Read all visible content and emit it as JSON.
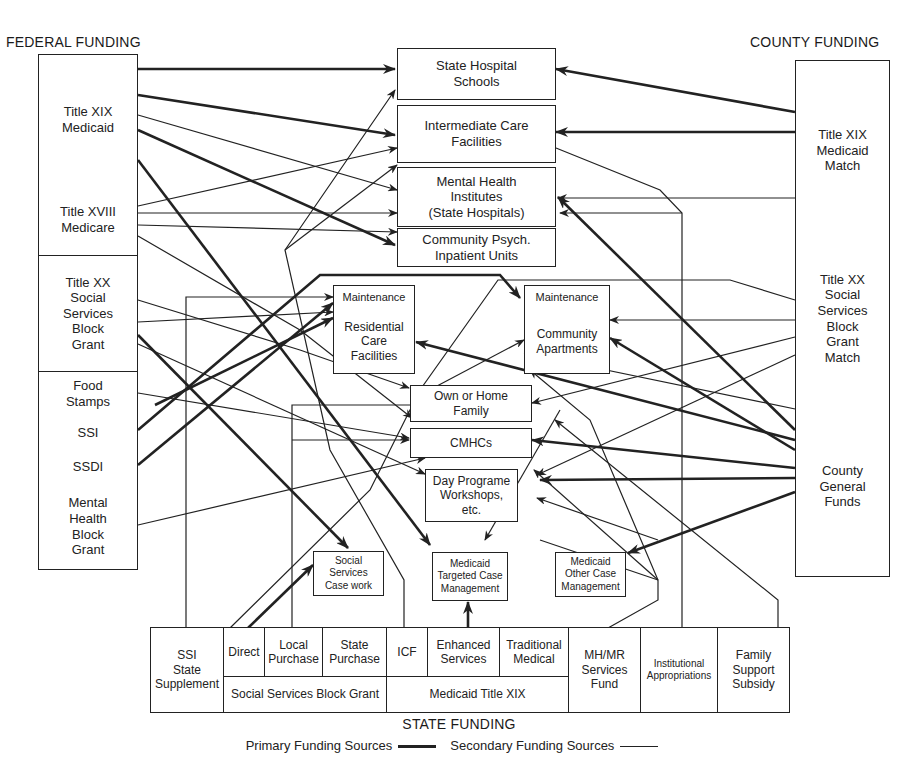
{
  "headings": {
    "federal": "FEDERAL FUNDING",
    "county": "COUNTY FUNDING",
    "state": "STATE FUNDING"
  },
  "legend": {
    "primary": "Primary Funding Sources",
    "secondary": "Secondary Funding Sources"
  },
  "federal_sources": [
    {
      "id": "fed-medicaid",
      "label": "Title XIX\nMedicaid"
    },
    {
      "id": "fed-medicare",
      "label": "Title XVIII\nMedicare"
    },
    {
      "id": "fed-ssbg",
      "label": "Title XX\nSocial\nServices\nBlock\nGrant"
    },
    {
      "id": "fed-food-stamps",
      "label": "Food\nStamps"
    },
    {
      "id": "fed-ssi",
      "label": "SSI"
    },
    {
      "id": "fed-ssdi",
      "label": "SSDI"
    },
    {
      "id": "fed-mhbg",
      "label": "Mental\nHealth\nBlock\nGrant"
    }
  ],
  "county_sources": [
    {
      "id": "cty-medicaid-match",
      "label": "Title XIX\nMedicaid\nMatch"
    },
    {
      "id": "cty-ssbg-match",
      "label": "Title XX\nSocial\nServices\nBlock\nGrant\nMatch"
    },
    {
      "id": "cty-general-funds",
      "label": "County\nGeneral\nFunds"
    }
  ],
  "services": [
    {
      "id": "svc-state-hospital-schools",
      "label": "State Hospital\nSchools"
    },
    {
      "id": "svc-icf",
      "label": "Intermediate Care\nFacilities"
    },
    {
      "id": "svc-mhi",
      "label": "Mental Health\nInstitutes\n(State Hospitals)"
    },
    {
      "id": "svc-community-psych",
      "label": "Community Psych.\nInpatient Units"
    },
    {
      "id": "svc-rcf-maintenance",
      "label": "Maintenance"
    },
    {
      "id": "svc-rcf",
      "label": "Residential\nCare\nFacilities"
    },
    {
      "id": "svc-apt-maintenance",
      "label": "Maintenance"
    },
    {
      "id": "svc-community-apartments",
      "label": "Community\nApartments"
    },
    {
      "id": "svc-home-family",
      "label": "Own or Home\nFamily"
    },
    {
      "id": "svc-cmhcs",
      "label": "CMHCs"
    },
    {
      "id": "svc-day-programs",
      "label": "Day Programe\nWorkshops,\netc."
    },
    {
      "id": "svc-ss-casework",
      "label": "Social\nServices\nCase work"
    },
    {
      "id": "svc-medicaid-tcm",
      "label": "Medicaid\nTargeted Case\nManagement"
    },
    {
      "id": "svc-medicaid-ocm",
      "label": "Medicaid\nOther Case\nManagement"
    }
  ],
  "state_sources": {
    "ssi_state_supplement": "SSI\nState\nSupplement",
    "direct": "Direct",
    "local_purchase": "Local\nPurchase",
    "state_purchase": "State\nPurchase",
    "icf": "ICF",
    "enhanced_services": "Enhanced\nServices",
    "traditional_medical": "Traditional\nMedical",
    "ssbg_group": "Social Services Block Grant",
    "medicaid_group": "Medicaid Title XIX",
    "mhmr_fund": "MH/MR\nServices\nFund",
    "institutional_appropriations": "Institutional\nAppropriations",
    "family_support_subsidy": "Family\nSupport\nSubsidy"
  },
  "colors": {
    "line": "#222222",
    "background": "#ffffff"
  },
  "connections": [
    {
      "from": "fed-medicaid",
      "to": "svc-state-hospital-schools",
      "type": "primary"
    },
    {
      "from": "fed-medicaid",
      "to": "svc-icf",
      "type": "primary"
    },
    {
      "from": "fed-medicaid",
      "to": "svc-mhi",
      "type": "secondary"
    },
    {
      "from": "fed-medicaid",
      "to": "svc-community-psych",
      "type": "primary"
    },
    {
      "from": "fed-medicaid",
      "to": "svc-medicaid-tcm",
      "type": "primary"
    },
    {
      "from": "fed-medicare",
      "to": "svc-icf",
      "type": "secondary"
    },
    {
      "from": "fed-medicare",
      "to": "svc-mhi",
      "type": "secondary"
    },
    {
      "from": "fed-medicare",
      "to": "svc-community-psych",
      "type": "secondary"
    },
    {
      "from": "fed-medicare",
      "to": "svc-cmhcs",
      "type": "secondary"
    },
    {
      "from": "fed-ssbg",
      "to": "svc-rcf",
      "type": "secondary"
    },
    {
      "from": "fed-ssbg",
      "to": "svc-home-family",
      "type": "secondary"
    },
    {
      "from": "fed-ssbg",
      "to": "svc-ss-casework",
      "type": "primary"
    },
    {
      "from": "fed-ssbg",
      "to": "svc-day-programs",
      "type": "secondary"
    },
    {
      "from": "fed-food-stamps",
      "to": "svc-cmhcs",
      "type": "secondary"
    },
    {
      "from": "fed-ssi",
      "to": "svc-apt-maintenance",
      "type": "primary"
    },
    {
      "from": "fed-ssdi",
      "to": "svc-rcf-maintenance",
      "type": "primary"
    },
    {
      "from": "fed-mhbg",
      "to": "svc-cmhcs",
      "type": "secondary"
    },
    {
      "from": "cty-medicaid-match",
      "to": "svc-state-hospital-schools",
      "type": "primary"
    },
    {
      "from": "cty-medicaid-match",
      "to": "svc-icf",
      "type": "primary"
    },
    {
      "from": "cty-medicaid-match",
      "to": "svc-mhi",
      "type": "secondary"
    },
    {
      "from": "cty-ssbg-match",
      "to": "svc-community-apartments",
      "type": "secondary"
    },
    {
      "from": "cty-ssbg-match",
      "to": "svc-home-family",
      "type": "secondary"
    },
    {
      "from": "cty-ssbg-match",
      "to": "svc-day-programs",
      "type": "secondary"
    },
    {
      "from": "cty-general-funds",
      "to": "svc-mhi",
      "type": "primary"
    },
    {
      "from": "cty-general-funds",
      "to": "svc-rcf",
      "type": "primary"
    },
    {
      "from": "cty-general-funds",
      "to": "svc-community-apartments",
      "type": "primary"
    },
    {
      "from": "cty-general-funds",
      "to": "svc-cmhcs",
      "type": "primary"
    },
    {
      "from": "cty-general-funds",
      "to": "svc-day-programs",
      "type": "primary"
    },
    {
      "from": "cty-general-funds",
      "to": "svc-medicaid-ocm",
      "type": "primary"
    },
    {
      "from": "state-direct",
      "to": "svc-ss-casework",
      "type": "primary"
    },
    {
      "from": "state-enhanced-services",
      "to": "svc-medicaid-tcm",
      "type": "primary"
    },
    {
      "from": "state-mhmr-fund",
      "to": "svc-mhi",
      "type": "secondary"
    },
    {
      "from": "state-institutional-appropriations",
      "to": "svc-state-hospital-schools",
      "type": "secondary"
    }
  ]
}
